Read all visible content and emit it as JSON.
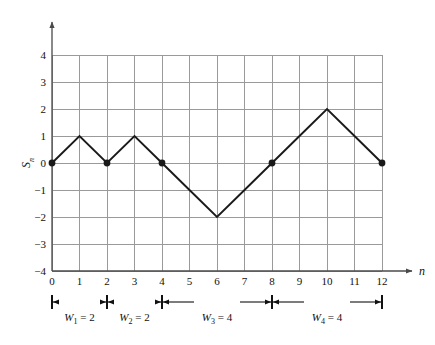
{
  "chart_data": {
    "type": "line",
    "title": "",
    "xlabel": "n",
    "ylabel": "S_n",
    "ylabel_display": "S",
    "ylabel_sub": "n",
    "xlim": [
      0,
      12
    ],
    "ylim": [
      -4,
      4
    ],
    "grid": true,
    "legend": "none",
    "x": [
      0,
      1,
      2,
      3,
      4,
      5,
      6,
      7,
      8,
      9,
      10,
      11,
      12
    ],
    "values": [
      0,
      1,
      0,
      1,
      0,
      -1,
      -2,
      -1,
      0,
      1,
      2,
      1,
      0
    ],
    "xticks": [
      "0",
      "1",
      "2",
      "3",
      "4",
      "5",
      "6",
      "7",
      "8",
      "9",
      "10",
      "11",
      "12"
    ],
    "yticks": [
      "4",
      "3",
      "2",
      "1",
      "0",
      "−1",
      "−2",
      "−3",
      "−4"
    ],
    "ytick_values": [
      4,
      3,
      2,
      1,
      0,
      -1,
      -2,
      -3,
      -4
    ],
    "markers": [
      {
        "x": 0,
        "y": 0
      },
      {
        "x": 2,
        "y": 0
      },
      {
        "x": 4,
        "y": 0
      },
      {
        "x": 8,
        "y": 0
      },
      {
        "x": 12,
        "y": 0
      }
    ],
    "annotations": [
      {
        "name": "W1",
        "symbol": "W",
        "sub": "1",
        "value": 2,
        "text": "W₁ = 2",
        "from_x": 0,
        "to_x": 2
      },
      {
        "name": "W2",
        "symbol": "W",
        "sub": "2",
        "value": 2,
        "text": "W₂ = 2",
        "from_x": 2,
        "to_x": 4
      },
      {
        "name": "W3",
        "symbol": "W",
        "sub": "3",
        "value": 4,
        "text": "W₃ = 4",
        "from_x": 4,
        "to_x": 8
      },
      {
        "name": "W4",
        "symbol": "W",
        "sub": "4",
        "value": 4,
        "text": "W₄ = 4",
        "from_x": 8,
        "to_x": 12
      }
    ],
    "colors": {
      "line": "#1a1a1a",
      "marker": "#1a1a1a",
      "grid": "#9a9a9a",
      "axis": "#4a4a4a",
      "background": "#ffffff",
      "text": "#111111"
    }
  }
}
